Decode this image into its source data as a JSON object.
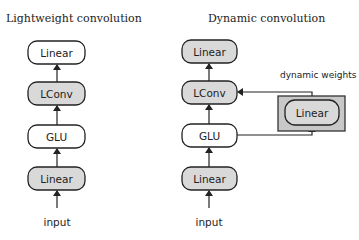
{
  "left": {
    "title": "Lightweight convolution",
    "nodes": [
      {
        "label": "Linear",
        "shaded": false
      },
      {
        "label": "LConv",
        "shaded": true
      },
      {
        "label": "GLU",
        "shaded": false
      },
      {
        "label": "Linear",
        "shaded": true
      }
    ],
    "input_label": "input"
  },
  "right": {
    "title": "Dynamic convolution",
    "nodes": [
      {
        "label": "Linear",
        "shaded": true
      },
      {
        "label": "LConv",
        "shaded": true
      },
      {
        "label": "GLU",
        "shaded": false
      },
      {
        "label": "Linear",
        "shaded": true
      }
    ],
    "input_label": "input",
    "side_branch": {
      "annotation": "dynamic weights",
      "node_label": "Linear"
    }
  },
  "colors": {
    "shaded_fill": "#d9d9d9",
    "outer_box_fill": "#c8c8c8",
    "stroke": "#222222"
  }
}
